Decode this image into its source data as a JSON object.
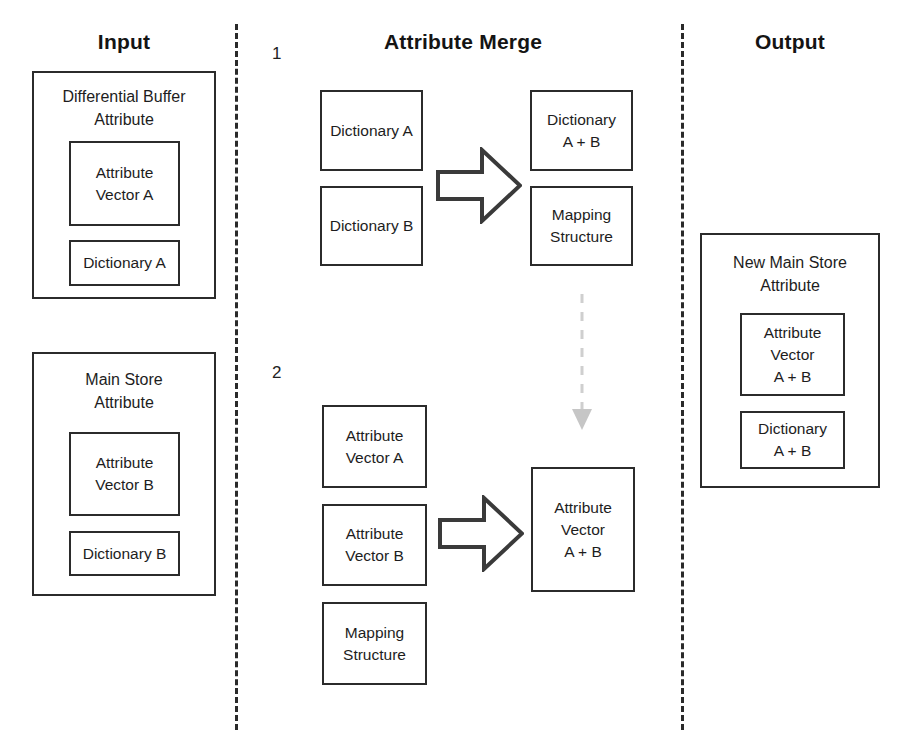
{
  "diagram": {
    "sections": {
      "input": "Input",
      "merge": "Attribute Merge",
      "output": "Output"
    },
    "steps": {
      "one": "1",
      "two": "2"
    }
  },
  "input_column": {
    "differential_buffer": {
      "title": "Differential Buffer\nAttribute",
      "children": [
        {
          "label": "Attribute\nVector A"
        },
        {
          "label": "Dictionary A"
        }
      ]
    },
    "main_store": {
      "title": "Main Store\nAttribute",
      "children": [
        {
          "label": "Attribute\nVector B"
        },
        {
          "label": "Dictionary B"
        }
      ]
    }
  },
  "merge_column": {
    "step1": {
      "inputs": [
        {
          "label": "Dictionary A"
        },
        {
          "label": "Dictionary B"
        }
      ],
      "outputs": [
        {
          "label": "Dictionary\nA + B"
        },
        {
          "label": "Mapping\nStructure"
        }
      ],
      "arrow": "merge-arrow-right"
    },
    "step2": {
      "inputs": [
        {
          "label": "Attribute\nVector A"
        },
        {
          "label": "Attribute\nVector B"
        },
        {
          "label": "Mapping\nStructure"
        }
      ],
      "outputs": [
        {
          "label": "Attribute\nVector\nA + B"
        }
      ],
      "arrow": "merge-arrow-right"
    },
    "connector": "dashed-down-arrow"
  },
  "output_column": {
    "new_main_store": {
      "title": "New Main Store\nAttribute",
      "children": [
        {
          "label": "Attribute\nVector\nA + B"
        },
        {
          "label": "Dictionary\nA + B"
        }
      ]
    }
  },
  "colors": {
    "stroke": "#2b2b2b",
    "text": "#1d1d1d",
    "background": "#ffffff",
    "separator": "#2a2a2a",
    "dashed_arrow": "#cccccc"
  }
}
